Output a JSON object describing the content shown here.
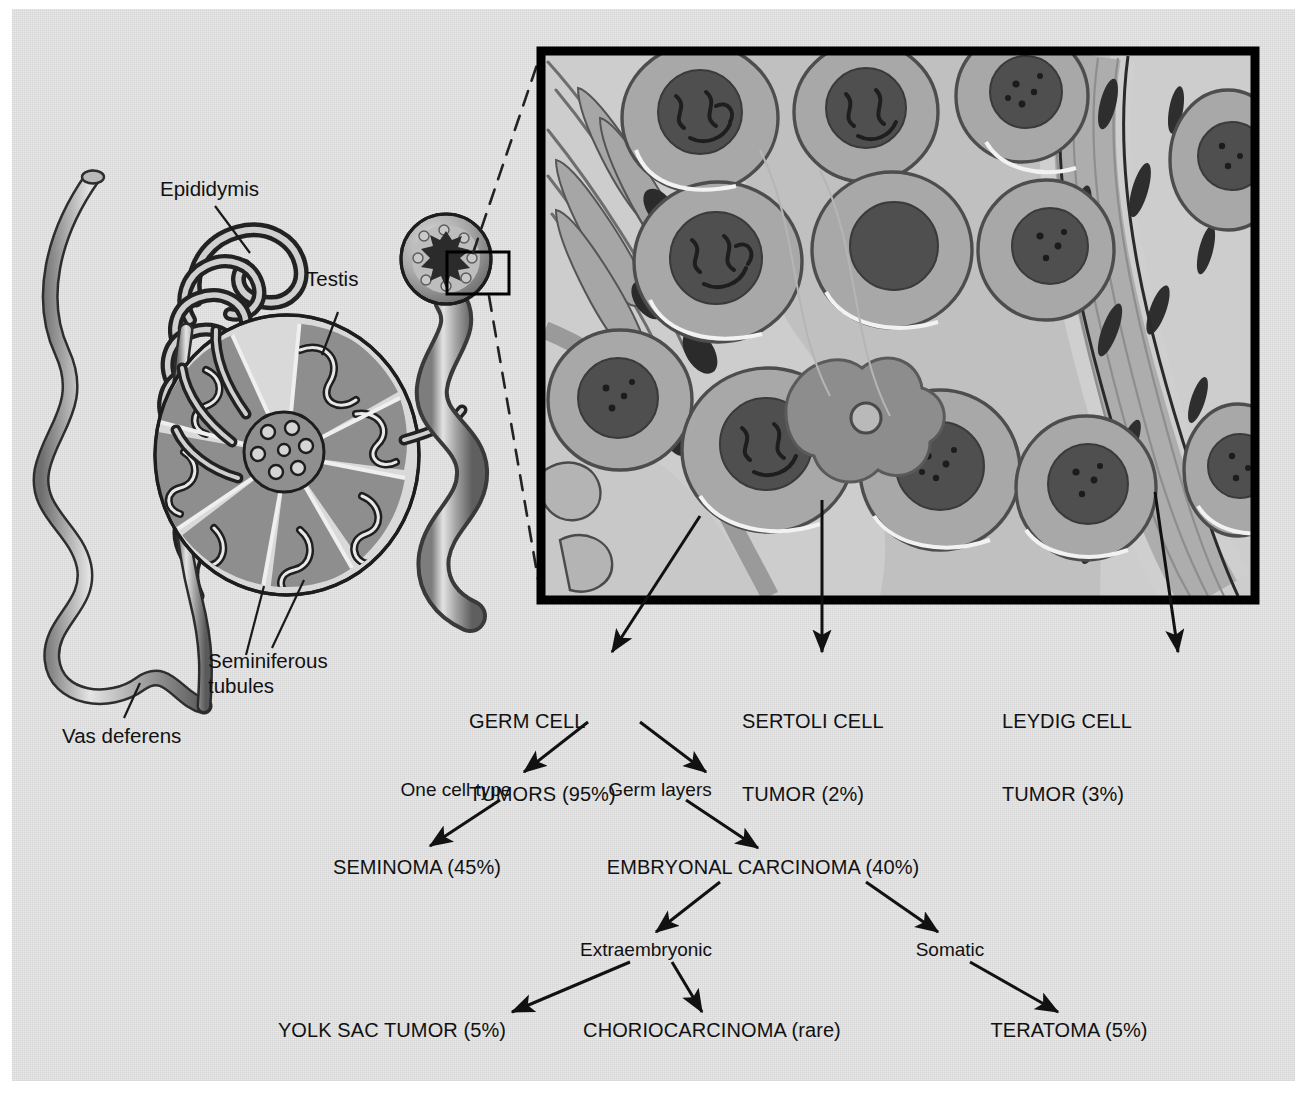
{
  "figure": {
    "type": "anatomy-diagram-with-flowchart"
  },
  "anatomy": {
    "labels": [
      {
        "id": "epididymis",
        "text": "Epididymis"
      },
      {
        "id": "testis",
        "text": "Testis"
      },
      {
        "id": "seminiferous-tubules",
        "text": "Seminiferous\ntubules"
      },
      {
        "id": "vas-deferens",
        "text": "Vas deferens"
      }
    ]
  },
  "inset": {
    "name": "seminiferous-tubule-histology-panel",
    "cell_types": [
      "germ cell",
      "Sertoli cell",
      "Leydig cell",
      "peritubular myoid cell",
      "spermatid"
    ]
  },
  "flowchart": {
    "tier1": [
      {
        "id": "germ-cell-tumors",
        "line1": "GERM CELL",
        "line2": "TUMORS (95%)",
        "percent": "95%"
      },
      {
        "id": "sertoli-cell-tumor",
        "line1": "SERTOLI CELL",
        "line2": "TUMOR (2%)",
        "percent": "2%"
      },
      {
        "id": "leydig-cell-tumor",
        "line1": "LEYDIG CELL",
        "line2": "TUMOR (3%)",
        "percent": "3%"
      }
    ],
    "tier2_branches": [
      {
        "id": "one-cell-type",
        "text": "One cell type"
      },
      {
        "id": "germ-layers",
        "text": "Germ layers"
      }
    ],
    "tier2": [
      {
        "id": "seminoma",
        "text": "SEMINOMA (45%)",
        "percent": "45%"
      },
      {
        "id": "embryonal-carcinoma",
        "text": "EMBRYONAL CARCINOMA (40%)",
        "percent": "40%"
      }
    ],
    "tier3_branches": [
      {
        "id": "extraembryonic",
        "text": "Extraembryonic"
      },
      {
        "id": "somatic",
        "text": "Somatic"
      }
    ],
    "tier3": [
      {
        "id": "yolk-sac-tumor",
        "text": "YOLK SAC TUMOR (5%)",
        "percent": "5%"
      },
      {
        "id": "choriocarcinoma",
        "text": "CHORIOCARCINOMA (rare)",
        "percent": "rare"
      },
      {
        "id": "teratoma",
        "text": "TERATOMA (5%)",
        "percent": "5%"
      }
    ]
  },
  "colors": {
    "paper": "#e6e6e6",
    "ink": "#111111",
    "tissue_mid": "#9a9a9a",
    "tissue_light": "#c4c4c4",
    "nucleus_dark": "#4a4a4a",
    "frame": "#000000"
  }
}
